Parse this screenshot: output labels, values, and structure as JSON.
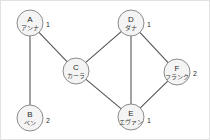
{
  "diagram": {
    "type": "undirected-graph",
    "title": "",
    "width": 210,
    "height": 140,
    "background_color": "#ffffff",
    "border_color": "#e2e2e2",
    "node_fill_color": "#f4f4f4",
    "node_stroke_color": "#8c8c8c",
    "edge_color": "#555555",
    "label_color": "#2b2b2b",
    "nodes": [
      {
        "id": "A",
        "letter": "A",
        "name": "アンナ",
        "badge": "1",
        "cx": 29,
        "cy": 22,
        "r": 13,
        "badge_x": 45,
        "badge_y": 24
      },
      {
        "id": "B",
        "letter": "B",
        "name": "ベン",
        "badge": "2",
        "cx": 29,
        "cy": 117,
        "r": 13,
        "badge_x": 45,
        "badge_y": 120
      },
      {
        "id": "C",
        "letter": "C",
        "name": "カーラ",
        "badge": "",
        "cx": 75,
        "cy": 70,
        "r": 13,
        "badge_x": 91,
        "badge_y": 72
      },
      {
        "id": "D",
        "letter": "D",
        "name": "ダナ",
        "badge": "1",
        "cx": 130,
        "cy": 22,
        "r": 13,
        "badge_x": 146,
        "badge_y": 24
      },
      {
        "id": "E",
        "letter": "E",
        "name": "エヴァン",
        "badge": "1",
        "cx": 130,
        "cy": 116,
        "r": 13,
        "badge_x": 146,
        "badge_y": 120
      },
      {
        "id": "F",
        "letter": "F",
        "name": "フランク",
        "badge": "2",
        "cx": 176,
        "cy": 71,
        "r": 13,
        "badge_x": 192,
        "badge_y": 73
      }
    ],
    "edges": [
      {
        "from": "A",
        "to": "B"
      },
      {
        "from": "A",
        "to": "C"
      },
      {
        "from": "C",
        "to": "D"
      },
      {
        "from": "C",
        "to": "E"
      },
      {
        "from": "D",
        "to": "E"
      },
      {
        "from": "D",
        "to": "F"
      },
      {
        "from": "E",
        "to": "F"
      }
    ]
  }
}
